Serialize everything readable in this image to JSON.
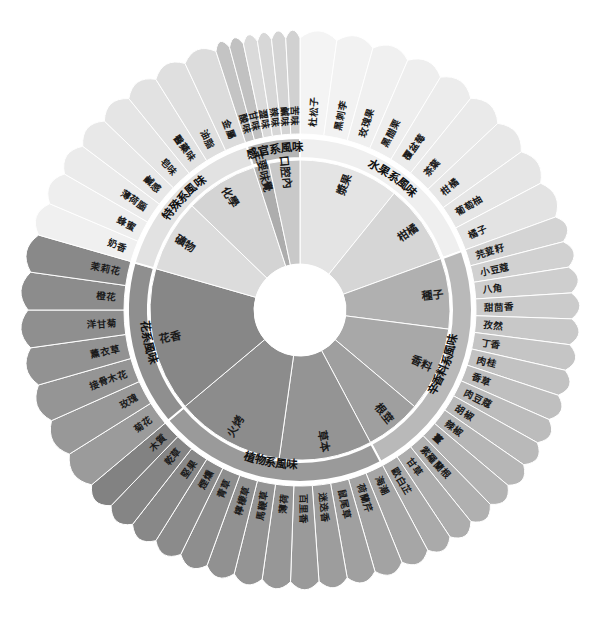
{
  "diagram": {
    "center_color": "#ffffff",
    "ring_divider_color": "#ffffff",
    "label_color": "#1b1b1b",
    "categories": [
      {
        "name": "水果系風味",
        "color": "#efefef",
        "start_angle": -90,
        "end_angle": -20,
        "subgroups": [
          {
            "name": "漿果",
            "color": "#e4e4e4",
            "items": [
              {
                "label": "杜松子",
                "color": "#f4f4f4"
              },
              {
                "label": "黑刺李",
                "color": "#f2f2f2"
              },
              {
                "label": "玫瑰果",
                "color": "#f0f0f0"
              },
              {
                "label": "黑醋栗",
                "color": "#eeeeee"
              },
              {
                "label": "覆盆莓",
                "color": "#ececec"
              }
            ]
          },
          {
            "name": "柑橘",
            "color": "#d6d6d6",
            "items": [
              {
                "label": "茶葉",
                "color": "#eaeaea"
              },
              {
                "label": "柑橘",
                "color": "#e8e8e8"
              },
              {
                "label": "葡萄柚",
                "color": "#e6e6e6"
              },
              {
                "label": "橘子",
                "color": "#e3e3e3"
              }
            ]
          }
        ]
      },
      {
        "name": "辛香料系風味",
        "color": "#b9b9b9",
        "start_angle": -20,
        "end_angle": 62,
        "subgroups": [
          {
            "name": "種子",
            "color": "#b0b0b0",
            "items": [
              {
                "label": "芫荽籽",
                "color": "#d4d4d4"
              },
              {
                "label": "小豆蔻",
                "color": "#d1d1d1"
              },
              {
                "label": "八角",
                "color": "#cecece"
              },
              {
                "label": "甜茴香",
                "color": "#cbcbcb"
              },
              {
                "label": "孜然",
                "color": "#c8c8c8"
              }
            ]
          },
          {
            "name": "香料",
            "color": "#a8a8a8",
            "items": [
              {
                "label": "丁香",
                "color": "#c5c5c5"
              },
              {
                "label": "肉桂",
                "color": "#c2c2c2"
              },
              {
                "label": "香草",
                "color": "#bfbfbf"
              },
              {
                "label": "肉豆蔻",
                "color": "#bcbcbc"
              },
              {
                "label": "胡椒",
                "color": "#b9b9b9"
              },
              {
                "label": "辣椒",
                "color": "#b6b6b6"
              }
            ]
          },
          {
            "name": "根莖",
            "color": "#9f9f9f",
            "items": [
              {
                "label": "薑",
                "color": "#b3b3b3"
              },
              {
                "label": "紫羅蘭根",
                "color": "#b0b0b0"
              },
              {
                "label": "甘草",
                "color": "#adadad"
              },
              {
                "label": "歐白芷",
                "color": "#aaaaaa"
              }
            ]
          }
        ]
      },
      {
        "name": "植物系風味",
        "color": "#9a9a9a",
        "start_angle": 62,
        "end_angle": 140,
        "subgroups": [
          {
            "name": "草本",
            "color": "#949494",
            "items": [
              {
                "label": "海潮",
                "color": "#a6a6a6"
              },
              {
                "label": "荷蘭芹",
                "color": "#a3a3a3"
              },
              {
                "label": "鼠尾草",
                "color": "#a0a0a0"
              },
              {
                "label": "迷迭香",
                "color": "#9d9d9d"
              },
              {
                "label": "百里香",
                "color": "#9a9a9a"
              },
              {
                "label": "薄荷",
                "color": "#979797"
              }
            ]
          },
          {
            "name": "火烤",
            "color": "#8c8c8c",
            "items": [
              {
                "label": "馬鞭草",
                "color": "#949494"
              },
              {
                "label": "檸檬草",
                "color": "#919191"
              },
              {
                "label": "青草",
                "color": "#8e8e8e"
              },
              {
                "label": "煙燻",
                "color": "#8b8b8b"
              },
              {
                "label": "堅果",
                "color": "#888888"
              },
              {
                "label": "乾草",
                "color": "#858585"
              },
              {
                "label": "木質",
                "color": "#828282"
              }
            ]
          }
        ]
      },
      {
        "name": "花系風味",
        "color": "#8f8f8f",
        "start_angle": 140,
        "end_angle": 196,
        "subgroups": [
          {
            "name": "花香",
            "color": "#878787",
            "items": [
              {
                "label": "菊花",
                "color": "#9b9b9b"
              },
              {
                "label": "玫瑰",
                "color": "#989898"
              },
              {
                "label": "接骨木花",
                "color": "#959595"
              },
              {
                "label": "薰衣草",
                "color": "#929292"
              },
              {
                "label": "洋甘菊",
                "color": "#8f8f8f"
              },
              {
                "label": "橙花",
                "color": "#8c8c8c"
              },
              {
                "label": "茉莉花",
                "color": "#898989"
              }
            ]
          }
        ]
      },
      {
        "name": "特殊系風味",
        "color": "#e2e2e2",
        "start_angle": 196,
        "end_angle": 252,
        "subgroups": [
          {
            "name": "礦物",
            "color": "#dcdcdc",
            "items": [
              {
                "label": "奶香",
                "color": "#f0f0f0"
              },
              {
                "label": "蜂蜜",
                "color": "#eeeeee"
              },
              {
                "label": "薄荷腦",
                "color": "#ebebeb"
              },
              {
                "label": "鹹感",
                "color": "#e8e8e8"
              }
            ]
          },
          {
            "name": "化學",
            "color": "#d4d4d4",
            "items": [
              {
                "label": "皂味",
                "color": "#e5e5e5"
              },
              {
                "label": "醫藥味",
                "color": "#e2e2e2"
              },
              {
                "label": "油脂",
                "color": "#dfdfdf"
              },
              {
                "label": "金屬",
                "color": "#dcdcdc"
              }
            ]
          }
        ]
      },
      {
        "name": "感官系風味",
        "color": "#b5b5b5",
        "start_angle": 252,
        "end_angle": 270,
        "subgroups": [
          {
            "name": "主要味覺",
            "color": "#adadad",
            "items": [
              {
                "label": "酸味",
                "color": "#c4c4c4"
              },
              {
                "label": "甘味",
                "color": "#c1c1c1"
              }
            ]
          },
          {
            "name": "口腔內",
            "color": "#c9c9c9",
            "items": [
              {
                "label": "澀味",
                "color": "#dadada"
              },
              {
                "label": "辣味",
                "color": "#d7d7d7"
              },
              {
                "label": "鹹味",
                "color": "#d4d4d4"
              },
              {
                "label": "苦味",
                "color": "#d1d1d1"
              }
            ]
          }
        ]
      }
    ]
  }
}
